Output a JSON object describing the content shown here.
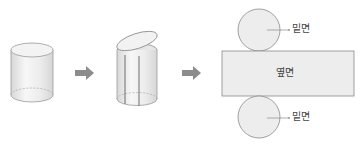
{
  "diagram": {
    "steps": [
      {
        "name": "cylinder"
      },
      {
        "name": "cylinder-cut-open"
      },
      {
        "name": "net"
      }
    ],
    "net": {
      "top_label": "밑면",
      "side_label": "옆면",
      "bottom_label": "밑면"
    },
    "colors": {
      "stroke": "#8a8a8a",
      "fill": "#ececec",
      "arrow": "#8c8c8c"
    }
  }
}
